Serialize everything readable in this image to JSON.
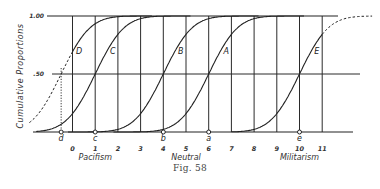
{
  "chart_data": {
    "type": "line",
    "title": "",
    "caption": "Fig. 58",
    "ylabel": "Cumulative Proportions",
    "xlabel": "",
    "xlim": [
      -1.6,
      12.2
    ],
    "ylim": [
      0,
      1
    ],
    "x_ticks": [
      0,
      1,
      2,
      3,
      4,
      5,
      6,
      7,
      8,
      9,
      10,
      11
    ],
    "x_tick_labels": [
      "0",
      "1",
      "2",
      "3",
      "4",
      "5",
      "6",
      "7",
      "8",
      "9",
      "10",
      "11"
    ],
    "y_ticks": [
      0.5,
      1.0
    ],
    "y_tick_labels": [
      ".50",
      "1.00"
    ],
    "grid": true,
    "group_labels": [
      {
        "text": "Pacifism",
        "x": 1
      },
      {
        "text": "Neutral",
        "x": 5
      },
      {
        "text": "Militarism",
        "x": 10
      }
    ],
    "series": [
      {
        "name": "D",
        "median": -0.5,
        "sd": 1.0,
        "solid_range": [
          0,
          3.5
        ],
        "point_label": "d"
      },
      {
        "name": "C",
        "median": 1,
        "sd": 1.0,
        "solid_range": [
          -1.5,
          5
        ],
        "point_label": "c"
      },
      {
        "name": "B",
        "median": 4,
        "sd": 1.0,
        "solid_range": [
          2,
          8
        ],
        "point_label": "b"
      },
      {
        "name": "A",
        "median": 6,
        "sd": 1.0,
        "solid_range": [
          4,
          10
        ],
        "point_label": "a"
      },
      {
        "name": "E",
        "median": 10,
        "sd": 1.0,
        "solid_range": [
          7,
          11
        ],
        "point_label": "e"
      }
    ]
  }
}
